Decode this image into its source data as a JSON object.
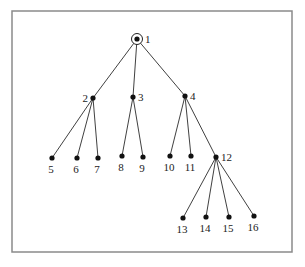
{
  "diagram": {
    "type": "rooted-tree",
    "root": "1",
    "frame": {
      "x": 12,
      "y": 11,
      "width": 280,
      "height": 241,
      "color": "#8a8a8a"
    },
    "nodes": [
      {
        "id": "1",
        "label": "1",
        "x": 137,
        "y": 39,
        "root": true,
        "label_pos": "right"
      },
      {
        "id": "2",
        "label": "2",
        "x": 93,
        "y": 98,
        "label_pos": "left"
      },
      {
        "id": "3",
        "label": "3",
        "x": 133,
        "y": 97,
        "label_pos": "right"
      },
      {
        "id": "4",
        "label": "4",
        "x": 185,
        "y": 96,
        "label_pos": "right"
      },
      {
        "id": "5",
        "label": "5",
        "x": 52,
        "y": 158,
        "label_pos": "below"
      },
      {
        "id": "6",
        "label": "6",
        "x": 77,
        "y": 158,
        "label_pos": "below"
      },
      {
        "id": "7",
        "label": "7",
        "x": 98,
        "y": 158,
        "label_pos": "below"
      },
      {
        "id": "8",
        "label": "8",
        "x": 122,
        "y": 156,
        "label_pos": "below"
      },
      {
        "id": "9",
        "label": "9",
        "x": 143,
        "y": 157,
        "label_pos": "below"
      },
      {
        "id": "10",
        "label": "10",
        "x": 170,
        "y": 156,
        "label_pos": "below"
      },
      {
        "id": "11",
        "label": "11",
        "x": 191,
        "y": 156,
        "label_pos": "below"
      },
      {
        "id": "12",
        "label": "12",
        "x": 216,
        "y": 157,
        "label_pos": "right"
      },
      {
        "id": "13",
        "label": "13",
        "x": 183,
        "y": 218,
        "label_pos": "below"
      },
      {
        "id": "14",
        "label": "14",
        "x": 206,
        "y": 217,
        "label_pos": "below"
      },
      {
        "id": "15",
        "label": "15",
        "x": 229,
        "y": 217,
        "label_pos": "below"
      },
      {
        "id": "16",
        "label": "16",
        "x": 254,
        "y": 216,
        "label_pos": "below"
      }
    ],
    "edges": [
      [
        "1",
        "2"
      ],
      [
        "1",
        "3"
      ],
      [
        "1",
        "4"
      ],
      [
        "2",
        "5"
      ],
      [
        "2",
        "6"
      ],
      [
        "2",
        "7"
      ],
      [
        "3",
        "8"
      ],
      [
        "3",
        "9"
      ],
      [
        "4",
        "10"
      ],
      [
        "4",
        "11"
      ],
      [
        "4",
        "12"
      ],
      [
        "12",
        "13"
      ],
      [
        "12",
        "14"
      ],
      [
        "12",
        "15"
      ],
      [
        "12",
        "16"
      ]
    ]
  }
}
